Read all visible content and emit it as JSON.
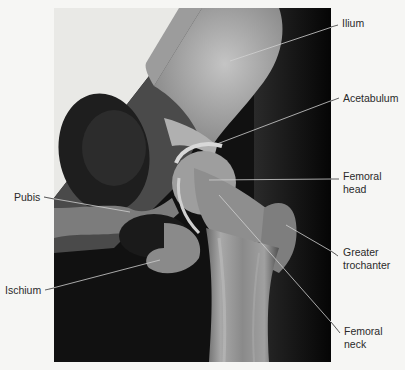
{
  "figure": {
    "type": "anatomical radiograph",
    "labels": [
      {
        "id": "ilium",
        "text": "Ilium",
        "x": 342,
        "y": 17,
        "line": [
          332,
          27,
          230,
          61
        ]
      },
      {
        "id": "acetabulum",
        "text": "Acetabulum",
        "x": 343,
        "y": 92,
        "line": [
          333,
          100,
          217,
          144
        ]
      },
      {
        "id": "femoral-head",
        "text": "Femoral head",
        "line1": "Femoral",
        "line2": "head",
        "x": 343,
        "y": 170,
        "line": [
          332,
          179,
          209,
          180
        ]
      },
      {
        "id": "pubis",
        "text": "Pubis",
        "x": 14,
        "y": 191,
        "line": [
          44,
          197,
          130,
          212
        ]
      },
      {
        "id": "greater-trochanter",
        "text": "Greater trochanter",
        "line1": "Greater",
        "line2": "trochanter",
        "x": 343,
        "y": 246,
        "line": [
          336,
          254,
          286,
          225
        ]
      },
      {
        "id": "ischium",
        "text": "Ischium",
        "x": 5,
        "y": 284,
        "line": [
          49,
          289,
          160,
          260
        ]
      },
      {
        "id": "femoral-neck",
        "text": "Femoral neck",
        "line1": "Femoral",
        "line2": "neck",
        "x": 344,
        "y": 325,
        "line": [
          338,
          330,
          219,
          195
        ]
      }
    ]
  },
  "colors": {
    "background": "#f6f6f4",
    "label_text": "#2a2a2a",
    "leader_line": "#3a3a3a",
    "xray_dark": "#0c0c0c",
    "bone_light": "#c8c8c8"
  }
}
